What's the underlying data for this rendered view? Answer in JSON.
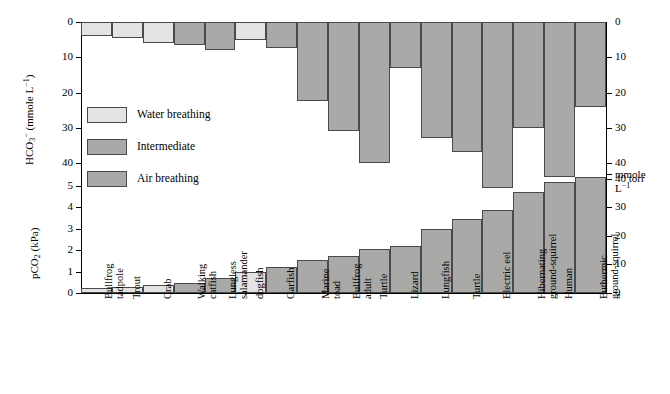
{
  "figure": {
    "background": "#ffffff",
    "bar_stroke": "#4a4a4a",
    "axis_color": "#000000"
  },
  "legend": {
    "items": [
      {
        "label": "Water breathing",
        "key": "water",
        "color": "#e3e3e1"
      },
      {
        "label": "Intermediate",
        "key": "intermediate",
        "color": "#a9a9a7"
      },
      {
        "label": "Air breathing",
        "key": "air",
        "color": "#a9a9a7"
      }
    ]
  },
  "axes": {
    "top_left_title_html": "HCO<sub>3</sub><sup>&#8722;</sup> (mmole L<sup>&#8722;1</sup>)",
    "bottom_left_title_html": "pCO<sub>2</sub> (kPa)",
    "top_left_ticks": [
      "0",
      "10",
      "20",
      "30",
      "40"
    ],
    "bottom_left_ticks": [
      "5",
      "4",
      "3",
      "2",
      "1",
      "0"
    ],
    "top_right_ticks": [
      "0",
      "10",
      "20",
      "30",
      "40"
    ],
    "top_right_unit_line1": "mmole",
    "top_right_unit_line2_html": "L<sup>&#8722;1</sup>",
    "bottom_right_ticks": [
      "40 torr",
      "30",
      "20",
      "10",
      "0"
    ]
  },
  "chart_data": {
    "type": "bar",
    "title": "",
    "panels": [
      {
        "name": "hco3-panel",
        "ylabel": "HCO3- (mmole L-1)",
        "ylabel_right": "mmole L-1",
        "ylim": [
          0,
          50
        ],
        "inverted": true,
        "grid": false,
        "units": "mmole L^-1",
        "values": [
          4,
          4.5,
          6,
          6.5,
          8,
          5,
          7.5,
          22.5,
          31,
          40,
          13,
          33,
          37,
          47,
          30,
          44,
          24,
          22.5
        ]
      },
      {
        "name": "pco2-panel",
        "ylabel": "pCO2 (kPa)",
        "ylabel_right": "torr",
        "ylim": [
          0,
          5.6
        ],
        "inverted": false,
        "grid": false,
        "units": "kPa",
        "values": [
          0.25,
          0.3,
          0.38,
          0.47,
          0.72,
          1.0,
          1.2,
          1.52,
          1.75,
          2.05,
          2.2,
          3.0,
          3.45,
          3.9,
          4.7,
          5.2,
          5.4
        ]
      }
    ],
    "categories": [
      "Bullfrog tadpole",
      "Trout",
      "Crab",
      "Walking catfish",
      "Lungless salamander",
      "dogfish",
      "Garfish",
      "Marine toad",
      "Bullfrog adult",
      "Turtle",
      "Lizard",
      "Lungfish",
      "Turtle",
      "Electric eel",
      "Hibernating ground-squirrel",
      "Human",
      "Euthermic ground-squirrel"
    ],
    "category_lines": [
      [
        "Bullfrog",
        "tadpole"
      ],
      [
        "Trout"
      ],
      [
        "Crab"
      ],
      [
        "Walking",
        "catfish"
      ],
      [
        "Lungless",
        "salamander"
      ],
      [
        "dogfish"
      ],
      [
        "Garfish"
      ],
      [
        "Marine",
        "toad"
      ],
      [
        "Bullfrog",
        "adult"
      ],
      [
        "Turtle"
      ],
      [
        "Lizard"
      ],
      [
        "Lungfish"
      ],
      [
        "Turtle"
      ],
      [
        "Electric eel"
      ],
      [
        "Hibernating",
        "ground-squirrel"
      ],
      [
        "Human"
      ],
      [
        "Euthermic",
        "ground-squirrel"
      ]
    ],
    "groups": [
      "water",
      "water",
      "water",
      "intermediate",
      "intermediate",
      "water",
      "intermediate",
      "air",
      "air",
      "air",
      "air",
      "air",
      "air",
      "air",
      "air",
      "air",
      "air"
    ],
    "legend_position": "inside-left"
  }
}
